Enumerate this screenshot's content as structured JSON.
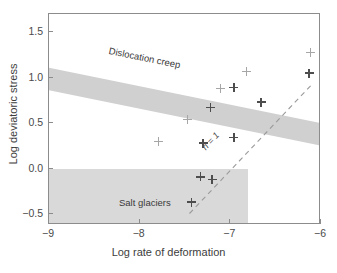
{
  "chart_data": {
    "type": "scatter",
    "title": "",
    "xlabel": "Log rate of deformation",
    "ylabel": "Log deviatoric stress",
    "xlim": [
      -9,
      -6
    ],
    "ylim": [
      -0.62,
      1.7
    ],
    "xticks": [
      -9,
      -8,
      -7,
      -6
    ],
    "xticklabels": [
      "−9",
      "−8",
      "−7",
      "−6"
    ],
    "yticks": [
      -0.5,
      0.0,
      0.5,
      1.0,
      1.5
    ],
    "yticklabels": [
      "−0.5",
      "0.0",
      "0.5",
      "1.0",
      "1.5"
    ],
    "grid": false,
    "legend": null,
    "series": [
      {
        "name": "Salt deformation data",
        "marker": "plus",
        "points": [
          {
            "x": -7.79,
            "y": 0.3,
            "weight": "light"
          },
          {
            "x": -7.47,
            "y": 0.54,
            "weight": "light"
          },
          {
            "x": -7.3,
            "y": 0.28,
            "weight": "dark"
          },
          {
            "x": -7.22,
            "y": 0.67,
            "weight": "dark"
          },
          {
            "x": -7.11,
            "y": 0.88,
            "weight": "light"
          },
          {
            "x": -6.96,
            "y": 0.89,
            "weight": "dark"
          },
          {
            "x": -6.82,
            "y": 1.07,
            "weight": "light"
          },
          {
            "x": -6.96,
            "y": 0.34,
            "weight": "dark"
          },
          {
            "x": -6.66,
            "y": 0.73,
            "weight": "dark"
          },
          {
            "x": -6.12,
            "y": 1.28,
            "weight": "light"
          },
          {
            "x": -6.13,
            "y": 1.05,
            "weight": "dark"
          },
          {
            "x": -7.33,
            "y": -0.09,
            "weight": "dark"
          },
          {
            "x": -7.2,
            "y": -0.12,
            "weight": "dark"
          },
          {
            "x": -7.43,
            "y": -0.37,
            "weight": "dark"
          }
        ]
      }
    ],
    "annotations": [
      {
        "name": "dislocation-creep",
        "text": "Dislocation creep",
        "type": "shaded-band",
        "slope": 0.233,
        "y_at_xmin": 1.17,
        "band_halfwidth": 0.07,
        "color": "#d0d0d0"
      },
      {
        "name": "salt-glaciers",
        "text": "Salt glaciers",
        "type": "shaded-box",
        "x_range": [
          -9,
          -6.6
        ],
        "y_range": [
          -0.62,
          -0.15
        ],
        "color": "#d9d9d9"
      },
      {
        "name": "n-equals-1-line",
        "text": "n = 1",
        "type": "dashed-line",
        "x_range": [
          -7.45,
          -6.1
        ],
        "y_range": [
          -0.36,
          1.06
        ],
        "style": "dashed",
        "color": "#9a9a9a"
      }
    ]
  },
  "labels": {
    "x_axis_title": "Log rate of deformation",
    "y_axis_title": "Log deviatoric stress",
    "dislocation_creep": "Dislocation creep",
    "salt_glaciers": "Salt glaciers",
    "n_equals_1": "n = 1"
  },
  "colors": {
    "band_fill": "#d0d0d0",
    "box_fill": "#d9d9d9",
    "axis": "#8c8c8c",
    "marker_dark": "#4d4d4d",
    "marker_light": "#a6a6a6",
    "dashed_line": "#9a9a9a",
    "text": "#3d3d3d",
    "background": "#ffffff"
  }
}
